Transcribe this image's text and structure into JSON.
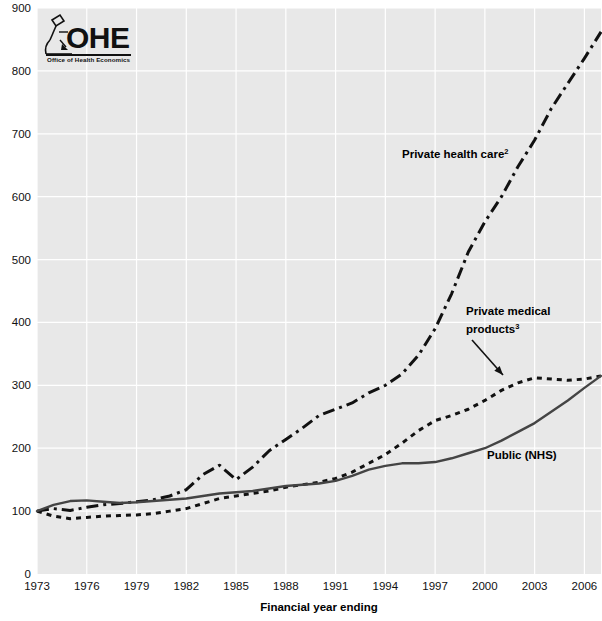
{
  "logo": {
    "name": "ohe-logo",
    "wordmark": "OHE",
    "subtitle": "Office of Health Economics"
  },
  "chart_data": {
    "type": "line",
    "title": "",
    "xlabel": "Financial year ending",
    "ylabel": "",
    "xlim": [
      1973,
      2007
    ],
    "ylim": [
      0,
      900
    ],
    "grid": true,
    "legend_position": "inline-annotations",
    "xticks": [
      1973,
      1976,
      1979,
      1982,
      1985,
      1988,
      1991,
      1994,
      1997,
      2000,
      2003,
      2006
    ],
    "yticks": [
      0,
      100,
      200,
      300,
      400,
      500,
      600,
      700,
      800,
      900
    ],
    "x": [
      1973,
      1974,
      1975,
      1976,
      1977,
      1978,
      1979,
      1980,
      1981,
      1982,
      1983,
      1984,
      1985,
      1986,
      1987,
      1988,
      1989,
      1990,
      1991,
      1992,
      1993,
      1994,
      1995,
      1996,
      1997,
      1998,
      1999,
      2000,
      2001,
      2002,
      2003,
      2004,
      2005,
      2006,
      2007
    ],
    "series": [
      {
        "name": "Private health care",
        "superscript": "2",
        "label": "Private health care",
        "style": "dash-dot",
        "color": "#111111",
        "values": [
          100,
          104,
          101,
          106,
          110,
          112,
          115,
          118,
          124,
          134,
          158,
          173,
          150,
          170,
          196,
          214,
          232,
          252,
          262,
          272,
          288,
          300,
          318,
          348,
          390,
          446,
          512,
          560,
          600,
          648,
          690,
          740,
          780,
          820,
          862
        ]
      },
      {
        "name": "Private medical products",
        "superscript": "3",
        "label": "Private medical products",
        "style": "dotted",
        "color": "#111111",
        "values": [
          100,
          92,
          88,
          90,
          92,
          93,
          94,
          96,
          100,
          104,
          112,
          120,
          124,
          128,
          132,
          138,
          142,
          146,
          152,
          162,
          176,
          190,
          208,
          228,
          244,
          252,
          262,
          276,
          292,
          304,
          312,
          310,
          308,
          310,
          315
        ]
      },
      {
        "name": "Public (NHS)",
        "superscript": "",
        "label": "Public (NHS)",
        "style": "solid",
        "color": "#444444",
        "values": [
          100,
          110,
          116,
          117,
          115,
          113,
          114,
          116,
          118,
          120,
          124,
          128,
          130,
          132,
          136,
          140,
          142,
          144,
          148,
          156,
          166,
          172,
          176,
          176,
          178,
          184,
          192,
          200,
          212,
          226,
          240,
          258,
          276,
          296,
          315
        ]
      }
    ],
    "annotations": [
      {
        "name": "private-health-care-label",
        "text": "Private health care",
        "sup": "2",
        "x": 402,
        "y": 158
      },
      {
        "name": "private-medical-products-label-line1",
        "text": "Private medical",
        "sup": "",
        "x": 466,
        "y": 315
      },
      {
        "name": "private-medical-products-label-line2",
        "text": "products",
        "sup": "3",
        "x": 466,
        "y": 333
      },
      {
        "name": "public-nhs-label",
        "text": "Public (NHS)",
        "sup": "",
        "x": 487,
        "y": 459
      }
    ],
    "pointer_arrow": {
      "name": "annotation-arrow",
      "x1": 472,
      "y1": 340,
      "x2": 503,
      "y2": 375
    }
  },
  "colors": {
    "plot_background": "#e8e8e8",
    "gridline": "#ffffff",
    "ink": "#111111",
    "nhs_line": "#444444"
  }
}
